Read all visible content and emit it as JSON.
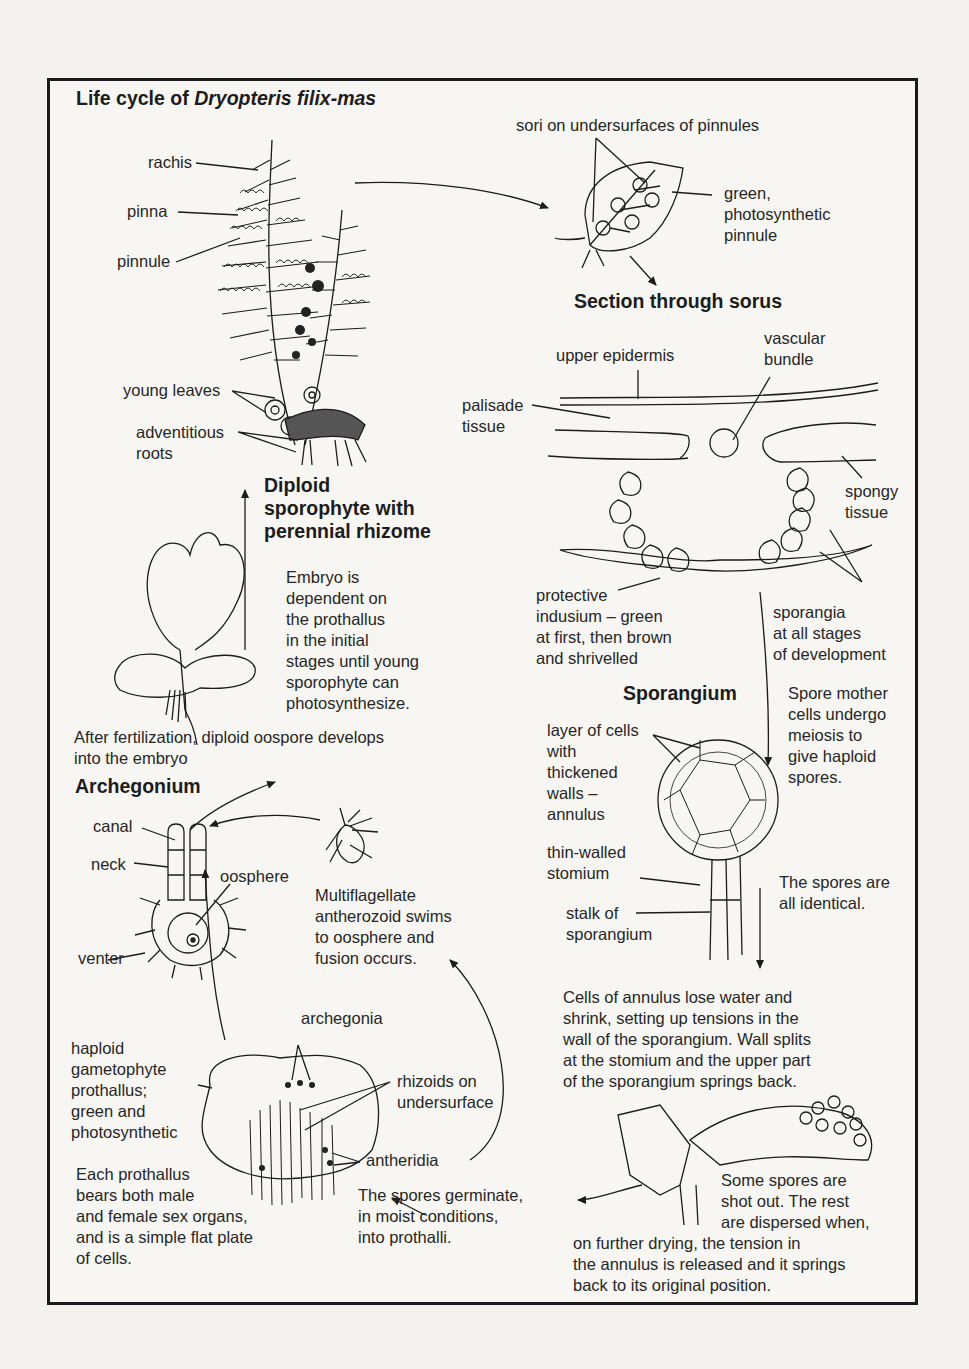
{
  "title": {
    "prefix": "Life cycle of ",
    "species": "Dryopteris filix-mas"
  },
  "sporophyte": {
    "labels": {
      "rachis": "rachis",
      "pinna": "pinna",
      "pinnule": "pinnule",
      "young_leaves": "young leaves",
      "adventitious_roots": "adventitious\nroots"
    },
    "heading": "Diploid\nsporophyte with\nperennial rhizome"
  },
  "pinnule_detail": {
    "sori_label": "sori on undersurfaces of pinnules",
    "pinnule_label": "green,\nphotosynthetic\npinnule"
  },
  "sorus_section": {
    "heading": "Section through sorus",
    "labels": {
      "upper_epidermis": "upper epidermis",
      "vascular_bundle": "vascular\nbundle",
      "palisade_tissue": "palisade\ntissue",
      "spongy_tissue": "spongy\ntissue",
      "indusium": "protective\nindusium – green\nat first, then brown\nand shrivelled",
      "sporangia": "sporangia\nat all stages\nof development"
    }
  },
  "embryo": {
    "note": "Embryo is\ndependent on\nthe prothallus\nin the initial\nstages until young\nsporophyte can\nphotosynthesize.",
    "fertilization_note": "After fertilization, diploid oospore develops\ninto the embryo"
  },
  "sporangium": {
    "heading": "Sporangium",
    "meiosis_note": "Spore mother\ncells undergo\nmeiosis to\ngive haploid\nspores.",
    "labels": {
      "annulus": "layer of cells\nwith\nthickened\nwalls –\nannulus",
      "stomium": "thin-walled\nstomium",
      "stalk": "stalk of\nsporangium"
    },
    "identical_note": "The spores are\nall identical.",
    "dehiscence_note": "Cells of annulus lose water and\nshrink, setting up tensions in the\nwall of the sporangium. Wall splits\nat the stomium and the upper part\nof the sporangium springs back.",
    "dispersal_note_a": "Some spores are\nshot out. The rest\nare dispersed when,",
    "dispersal_note_b": "on further drying, the tension in\nthe annulus is released and it springs\nback to its original position."
  },
  "archegonium": {
    "heading": "Archegonium",
    "labels": {
      "canal": "canal",
      "neck": "neck",
      "oosphere": "oosphere",
      "venter": "venter"
    },
    "antherozoid_note": "Multiflagellate\nantherozoid swims\nto oosphere and\nfusion occurs."
  },
  "prothallus": {
    "labels": {
      "archegonia": "archegonia",
      "rhizoids": "rhizoids on\nundersurface",
      "antheridia": "antheridia",
      "gametophyte": "haploid\ngametophyte\nprothallus;\ngreen and\nphotosynthetic"
    },
    "sex_organs_note": "Each prothallus\nbears both male\nand female sex organs,\nand is a simple flat plate\nof cells.",
    "germination_note": "The spores germinate,\nin moist conditions,\ninto prothalli."
  },
  "colors": {
    "ink": "#1c1c1c",
    "paper": "#f3f2ef"
  }
}
